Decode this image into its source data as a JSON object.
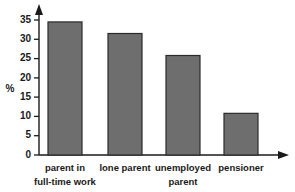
{
  "chart_data": {
    "type": "bar",
    "title": "",
    "subtitle": "",
    "xlabel": "",
    "ylabel": "%",
    "categories": [
      "parent in full-time work",
      "lone parent",
      "unemployed parent",
      "pensioner"
    ],
    "category_lines": [
      [
        "parent in",
        "full-time work"
      ],
      [
        "lone parent",
        ""
      ],
      [
        "unemployed",
        "parent"
      ],
      [
        "pensioner",
        ""
      ]
    ],
    "values": [
      34.5,
      31.5,
      25.8,
      10.8
    ],
    "ylim": [
      0,
      36
    ],
    "yticks": [
      0,
      5,
      10,
      15,
      20,
      25,
      30,
      35
    ],
    "ytick_labels": [
      "0",
      "5",
      "10",
      "15",
      "20",
      "25",
      "30",
      "35"
    ],
    "grid": false,
    "legend": null,
    "bar_color": "#6e6e6e",
    "bar_edge_color": "#2a2a2a",
    "axis_color": "#1a1a1a",
    "background_color": "#ffffff",
    "y_axis_arrow": true,
    "x_axis_arrow": true
  }
}
